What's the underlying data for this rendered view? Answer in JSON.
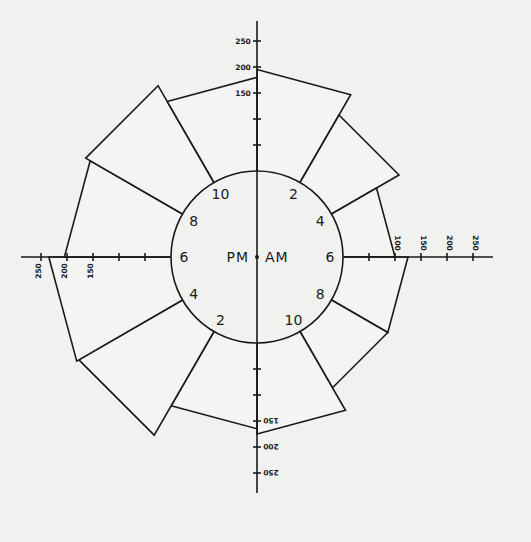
{
  "chart_data": {
    "type": "bar",
    "subtype": "polar-rose-24h",
    "title": "",
    "center_labels": {
      "left": "PM",
      "right": "AM"
    },
    "hour_labels": {
      "am": [
        "2",
        "4",
        "6",
        "8",
        "10"
      ],
      "pm": [
        "2",
        "4",
        "6",
        "8",
        "10"
      ]
    },
    "axis": {
      "ticks": [
        50,
        100,
        150,
        200,
        250
      ],
      "labeled_ticks": [
        "150",
        "200",
        "250"
      ],
      "right_labeled_ticks": [
        "100",
        "150",
        "200",
        "250"
      ],
      "range": [
        0,
        250
      ]
    },
    "categories": [
      "12-2 AM",
      "2-4 AM",
      "4-6 AM",
      "6-8 AM",
      "8-10 AM",
      "10-12 AM",
      "12-2 PM",
      "2-4 PM",
      "4-6 PM",
      "6-8 PM",
      "8-10 PM",
      "10-12 PM"
    ],
    "values": [
      195,
      150,
      100,
      125,
      125,
      175,
      165,
      230,
      235,
      205,
      215,
      180
    ],
    "xlabel": "",
    "ylabel": ""
  }
}
